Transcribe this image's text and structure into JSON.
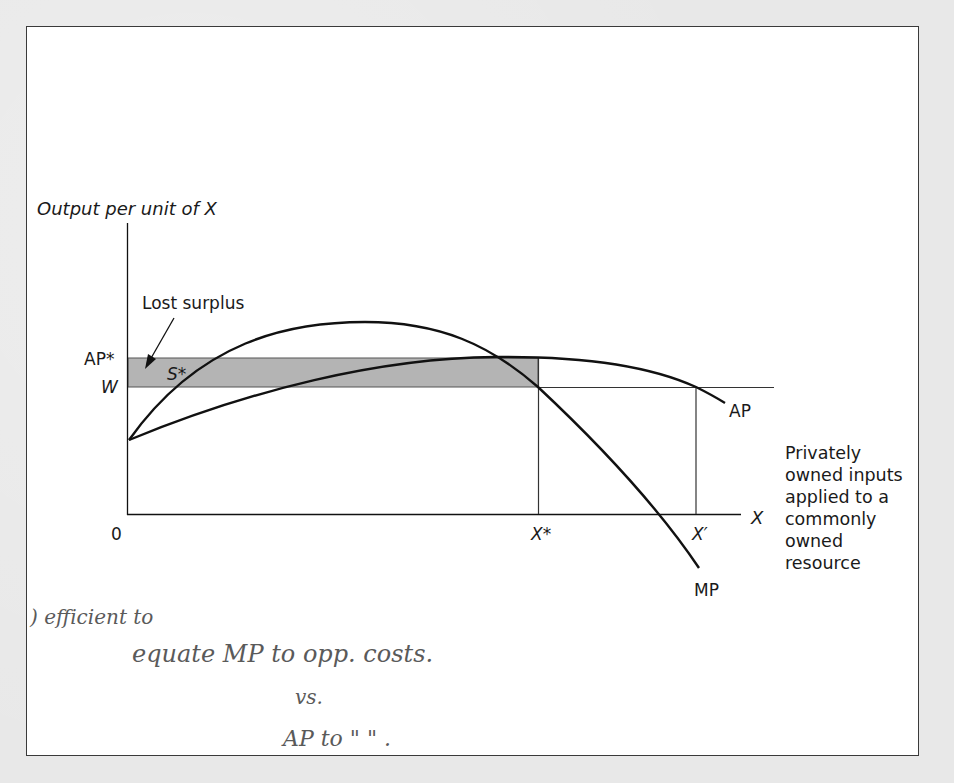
{
  "figure": {
    "y_axis_label": "Output per unit of X",
    "x_axis_label": "X",
    "origin_label": "0",
    "annotation_lost_surplus": "Lost surplus",
    "shaded_region_label": "S*",
    "y_tick_ap_star": "AP*",
    "y_tick_w": "W",
    "x_tick_x_star": "X*",
    "x_tick_x_prime": "X′",
    "curve_ap_label": "AP",
    "curve_mp_label": "MP",
    "side_note_lines": [
      "Privately",
      "owned inputs",
      "applied to a",
      "commonly",
      "owned",
      "resource"
    ],
    "colors": {
      "shade": "#b4b4b4",
      "line": "#111111",
      "frame": "#3a3a3a",
      "background": "#e8e8e8"
    }
  },
  "handwritten_notes": {
    "line1": ") efficient to",
    "line2": "equate MP to opp. costs.",
    "line3": "vs.",
    "line4": "AP to \"  \"  ."
  }
}
